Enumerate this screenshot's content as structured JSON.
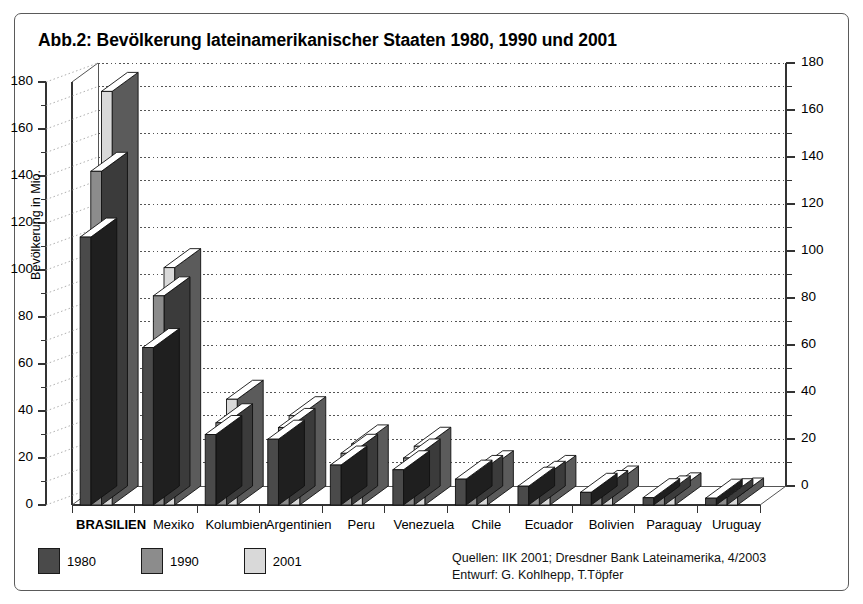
{
  "figure": {
    "title": "Abb.2: Bevölkerung lateinamerikanischer Staaten 1980, 1990 und 2001"
  },
  "legend": {
    "entries": [
      {
        "label": "1980",
        "color": "#4a4a4a"
      },
      {
        "label": "1990",
        "color": "#8c8c8c"
      },
      {
        "label": "2001",
        "color": "#d9d9d9"
      }
    ]
  },
  "source": {
    "line1": "Quellen: IIK 2001; Dresdner Bank Lateinamerika, 4/2003",
    "line2": "Entwurf: G. Kohlhepp, T.Töpfer"
  },
  "chart_data": {
    "type": "bar",
    "title": "Abb.2: Bevölkerung lateinamerikanischer Staaten 1980, 1990 und 2001",
    "xlabel": "",
    "ylabel": "Bevölkerung in Mio.",
    "ylim": [
      0,
      180
    ],
    "ytick_step": 20,
    "yminor_step": 10,
    "yticks": [
      0,
      20,
      40,
      60,
      80,
      100,
      120,
      140,
      160,
      180
    ],
    "ytick_labels": [
      "0",
      "20",
      "40",
      "60",
      "80",
      "100",
      "120",
      "140",
      "160",
      "180"
    ],
    "dual_axis": true,
    "grid": true,
    "grid_style": "dotted",
    "legend_position": "bottom-left",
    "three_d": true,
    "categories": [
      "BRASILIEN",
      "Mexiko",
      "Kolumbien",
      "Argentinien",
      "Peru",
      "Venezuela",
      "Chile",
      "Ecuador",
      "Bolivien",
      "Paraguay",
      "Uruguay"
    ],
    "bold_categories": [
      "BRASILIEN"
    ],
    "series": [
      {
        "name": "1980",
        "color": "#4a4a4a",
        "values": [
          114,
          67,
          30,
          28,
          17,
          15,
          11,
          8,
          5.4,
          3.1,
          2.9
        ]
      },
      {
        "name": "1990",
        "color": "#8c8c8c",
        "values": [
          142,
          89,
          35,
          33,
          22,
          20,
          13,
          10.5,
          6.6,
          4.3,
          3.1
        ]
      },
      {
        "name": "2001",
        "color": "#d9d9d9",
        "values": [
          176,
          101,
          45,
          38,
          26,
          25,
          15,
          13,
          8.5,
          5.6,
          3.4
        ]
      }
    ]
  }
}
